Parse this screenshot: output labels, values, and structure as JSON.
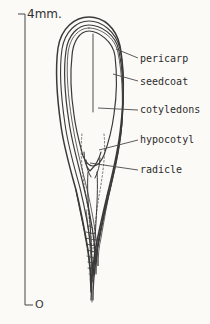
{
  "figure": {
    "kind": "botanical-line-drawing",
    "background_color": "#fbfaf7",
    "ink_color": "#3a3a3a"
  },
  "scale": {
    "top_label": "4mm.",
    "bottom_label": "O",
    "bar_name": "scale-bar"
  },
  "labels": [
    {
      "id": "pericarp",
      "text": "pericarp"
    },
    {
      "id": "seedcoat",
      "text": "seedcoat"
    },
    {
      "id": "cotyledons",
      "text": "cotyledons"
    },
    {
      "id": "hypocotyl",
      "text": "hypocotyl"
    },
    {
      "id": "radicle",
      "text": "radicle"
    }
  ]
}
